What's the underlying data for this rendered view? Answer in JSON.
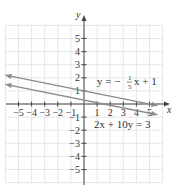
{
  "chart_data": {
    "type": "line",
    "title": "",
    "xlabel": "x",
    "ylabel": "y",
    "xlim": [
      -6,
      6
    ],
    "ylim": [
      -6,
      6
    ],
    "grid": true,
    "x_ticks": [
      -5,
      -4,
      -3,
      -2,
      -1,
      1,
      2,
      3,
      4,
      5
    ],
    "y_ticks": [
      5,
      4,
      3,
      2,
      1,
      -1,
      -2,
      -3,
      -4,
      -5
    ],
    "x_tick_labels": [
      "−5",
      "−4",
      "−3",
      "−2",
      "−1",
      "1",
      "2",
      "3",
      "4",
      "5"
    ],
    "y_tick_labels": [
      "5",
      "4",
      "3",
      "2",
      "1",
      "−1",
      "−2",
      "−3",
      "−4",
      "−5"
    ],
    "series": [
      {
        "name": "y = −(1/5)x + 1",
        "label_text": "y = −",
        "label_frac_num": "1",
        "label_frac_den": "5",
        "label_tail": "x + 1",
        "slope": -0.2,
        "intercept": 1,
        "x": [
          -6,
          5.6
        ],
        "y": [
          2.2,
          -0.12
        ],
        "color": "#8a8a8a"
      },
      {
        "name": "2x + 10y = 3",
        "label_text": "2x + 10y = 3",
        "slope": -0.2,
        "intercept": 0.3,
        "x": [
          -6,
          5.6
        ],
        "y": [
          1.5,
          -0.82
        ],
        "color": "#8a8a8a"
      }
    ],
    "annotations": [
      "y = −(1/5)x + 1",
      "2x + 10y = 3"
    ]
  },
  "colors": {
    "grid": "#e6e6e6",
    "axis": "#444444",
    "line": "#8a8a8a",
    "text": "#333333"
  }
}
